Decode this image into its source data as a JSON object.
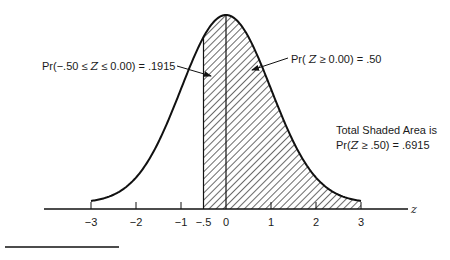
{
  "chart_data": {
    "type": "area",
    "title": "",
    "xlabel": "z",
    "ylabel": "",
    "xlim": [
      -3,
      3
    ],
    "x_ticks": [
      -3,
      -2,
      -1,
      -0.5,
      0,
      1,
      2,
      3
    ],
    "x_tick_labels": [
      "−3",
      "−2",
      "−1",
      "−.5",
      "0",
      "1",
      "2",
      "3"
    ],
    "grid": false,
    "curve": {
      "distribution": "standard normal",
      "mean": 0,
      "sd": 1
    },
    "shaded_region": {
      "from": -0.5,
      "to": 3,
      "pattern": "diagonal hatch"
    },
    "vertical_lines": [
      -0.5,
      0
    ],
    "annotations": [
      {
        "id": "left",
        "text": "Pr(−.50 ≤ Z ≤ 0.00) = .1915",
        "points_to": "region between -0.5 and 0"
      },
      {
        "id": "right",
        "text": "Pr( Z ≥ 0.00) = .50",
        "points_to": "region right of 0"
      },
      {
        "id": "total_line1",
        "text": "Total Shaded Area is"
      },
      {
        "id": "total_line2",
        "text": "Pr(Z ≥ .50) = .6915"
      }
    ],
    "values": {
      "pr_neg05_to_0": 0.1915,
      "pr_ge_0": 0.5,
      "total_shaded": 0.6915
    }
  },
  "labels": {
    "left_prefix": "Pr(−.50 ≤ ",
    "left_var": "Z",
    "left_suffix": " ≤ 0.00) = .1915",
    "right_prefix": "Pr( ",
    "right_var": "Z",
    "right_suffix": " ≥ 0.00) = .50",
    "total_line1": "Total Shaded Area is",
    "total_line2_prefix": "Pr(",
    "total_line2_var": "Z",
    "total_line2_suffix": " ≥ .50) = .6915",
    "axis_var": "z"
  },
  "ticks": [
    {
      "z": -3,
      "label": "−3"
    },
    {
      "z": -2,
      "label": "−2"
    },
    {
      "z": -1,
      "label": "−1"
    },
    {
      "z": -0.5,
      "label": "−.5"
    },
    {
      "z": 0,
      "label": "0"
    },
    {
      "z": 1,
      "label": "1"
    },
    {
      "z": 2,
      "label": "2"
    },
    {
      "z": 3,
      "label": "3"
    }
  ]
}
